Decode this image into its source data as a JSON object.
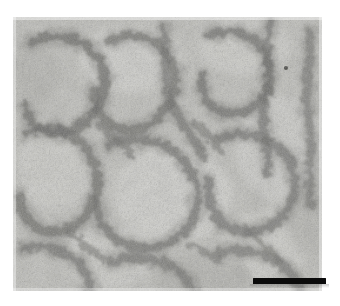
{
  "figure": {
    "type": "electron-micrograph",
    "modality": "transmission electron microscopy, negative stain",
    "caption": "",
    "background_color": "#ffffff",
    "plate": {
      "left_px": 13,
      "top_px": 17,
      "width_px": 309,
      "height_px": 274,
      "mean_tone": "#b9b9b4",
      "light_tone": "#dcdcd8",
      "dark_tone": "#4a4a46",
      "grain": "fine speckled negative stain"
    },
    "scale_bar": {
      "label": "",
      "color": "#0b0b0b",
      "left_px": 253,
      "top_px": 278,
      "length_px": 73,
      "thickness_px": 6,
      "position": "bottom-right"
    },
    "features": {
      "description": "Dark curvilinear loop-like filament bundles forming irregular rings over a granular stained background",
      "visible_marks": [
        {
          "name": "dark-speck",
          "x_px": 286,
          "y_px": 68,
          "radius_px": 2
        }
      ]
    }
  },
  "chart_data": {
    "type": "heatmap",
    "title": "",
    "xlabel": "",
    "ylabel": "",
    "note": "Grayscale micrograph intensity field; darker = heavier stain accumulation along filament loops."
  }
}
